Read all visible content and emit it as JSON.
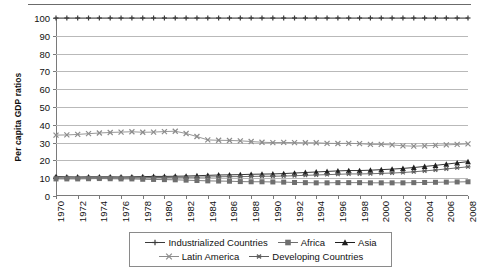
{
  "chart_data": {
    "type": "line",
    "title": "",
    "subtitle": "",
    "xlabel": "",
    "ylabel": "Per capita GDP ratios",
    "ylim": [
      0,
      100
    ],
    "ytick_labels": [
      "0",
      "10",
      "20",
      "30",
      "40",
      "50",
      "60",
      "70",
      "80",
      "90",
      "100"
    ],
    "ytick_values": [
      0,
      10,
      20,
      30,
      40,
      50,
      60,
      70,
      80,
      90,
      100
    ],
    "xlim": [
      1970,
      2008
    ],
    "xtick_labels": [
      "1970",
      "1972",
      "1974",
      "1976",
      "1978",
      "1980",
      "1982",
      "1984",
      "1986",
      "1988",
      "1990",
      "1992",
      "1994",
      "1996",
      "1998",
      "2000",
      "2002",
      "2004",
      "2006",
      "2008"
    ],
    "xtick_values": [
      1970,
      1972,
      1974,
      1976,
      1978,
      1980,
      1982,
      1984,
      1986,
      1988,
      1990,
      1992,
      1994,
      1996,
      1998,
      2000,
      2002,
      2004,
      2006,
      2008
    ],
    "x": [
      1970,
      1971,
      1972,
      1973,
      1974,
      1975,
      1976,
      1977,
      1978,
      1979,
      1980,
      1981,
      1982,
      1983,
      1984,
      1985,
      1986,
      1987,
      1988,
      1989,
      1990,
      1991,
      1992,
      1993,
      1994,
      1995,
      1996,
      1997,
      1998,
      1999,
      2000,
      2001,
      2002,
      2003,
      2004,
      2005,
      2006,
      2007,
      2008
    ],
    "grid": "horizontal",
    "legend_position": "below",
    "series": [
      {
        "name": "Industrialized Countries",
        "marker": "plus",
        "color": "#3a3a3a",
        "values": [
          100,
          100,
          100,
          100,
          100,
          100,
          100,
          100,
          100,
          100,
          100,
          100,
          100,
          100,
          100,
          100,
          100,
          100,
          100,
          100,
          100,
          100,
          100,
          100,
          100,
          100,
          100,
          100,
          100,
          100,
          100,
          100,
          100,
          100,
          100,
          100,
          100,
          100,
          100
        ]
      },
      {
        "name": "Latin America",
        "marker": "x",
        "color": "#8c8c8c",
        "values": [
          34.2,
          34.3,
          34.6,
          35.0,
          35.4,
          35.7,
          35.9,
          36.1,
          35.8,
          35.9,
          36.2,
          36.4,
          35.1,
          33.4,
          31.5,
          31.3,
          31.2,
          31.0,
          30.6,
          30.2,
          30.0,
          30.1,
          30.0,
          29.9,
          29.9,
          29.6,
          29.5,
          29.6,
          29.4,
          29.0,
          29.0,
          28.7,
          28.2,
          28.0,
          28.2,
          28.4,
          28.7,
          29.0,
          29.3
        ]
      },
      {
        "name": "Asia",
        "marker": "triangle",
        "color": "#1f1f1f",
        "values": [
          10.9,
          10.8,
          10.7,
          10.8,
          10.8,
          10.8,
          10.7,
          10.8,
          10.9,
          11.0,
          11.0,
          11.1,
          11.2,
          11.4,
          11.6,
          11.8,
          11.9,
          12.0,
          12.2,
          12.3,
          12.4,
          12.6,
          12.9,
          13.2,
          13.5,
          13.8,
          14.1,
          14.3,
          14.3,
          14.5,
          14.8,
          15.1,
          15.5,
          16.0,
          16.6,
          17.2,
          17.9,
          18.6,
          19.3
        ]
      },
      {
        "name": "Developing Countries",
        "marker": "asterisk",
        "color": "#5e5e5e",
        "values": [
          10.3,
          10.2,
          10.2,
          10.3,
          10.3,
          10.3,
          10.2,
          10.3,
          10.3,
          10.4,
          10.4,
          10.5,
          10.5,
          10.6,
          10.7,
          10.8,
          10.9,
          10.9,
          11.0,
          11.1,
          11.1,
          11.2,
          11.4,
          11.6,
          11.8,
          12.0,
          12.2,
          12.4,
          12.4,
          12.5,
          12.7,
          12.9,
          13.2,
          13.6,
          14.1,
          14.6,
          15.2,
          15.8,
          16.4
        ]
      },
      {
        "name": "Africa",
        "marker": "square",
        "color": "#6f6f6f",
        "values": [
          9.6,
          9.6,
          9.6,
          9.7,
          9.8,
          9.7,
          9.6,
          9.6,
          9.4,
          9.3,
          9.2,
          9.1,
          8.9,
          8.7,
          8.5,
          8.4,
          8.3,
          8.1,
          8.0,
          8.0,
          7.9,
          7.8,
          7.6,
          7.5,
          7.4,
          7.4,
          7.5,
          7.5,
          7.5,
          7.4,
          7.4,
          7.4,
          7.4,
          7.5,
          7.6,
          7.7,
          7.8,
          7.9,
          8.0
        ]
      }
    ]
  },
  "legend": {
    "row1": [
      {
        "label": "Industrialized Countries",
        "marker": "plus",
        "color": "#3a3a3a"
      },
      {
        "label": "Africa",
        "marker": "square",
        "color": "#6f6f6f"
      },
      {
        "label": "Asia",
        "marker": "triangle",
        "color": "#1f1f1f"
      }
    ],
    "row2": [
      {
        "label": "Latin America",
        "marker": "x",
        "color": "#8c8c8c"
      },
      {
        "label": "Developing Countries",
        "marker": "asterisk",
        "color": "#5e5e5e"
      }
    ]
  }
}
